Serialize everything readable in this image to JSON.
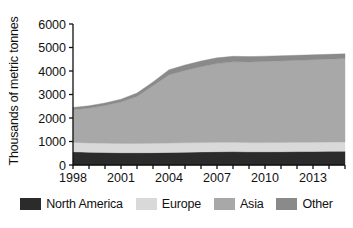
{
  "chart_data": {
    "type": "area",
    "stacked": true,
    "title": "",
    "subtitle": "",
    "xlabel": "",
    "ylabel": "Thousands of metric tonnes",
    "xlim": [
      1998,
      2015
    ],
    "ylim": [
      0,
      6000
    ],
    "grid": false,
    "legend_position": "bottom",
    "x": [
      1998,
      1999,
      2000,
      2001,
      2002,
      2003,
      2004,
      2005,
      2006,
      2007,
      2008,
      2009,
      2010,
      2011,
      2012,
      2013,
      2014,
      2015
    ],
    "xticks": [
      1998,
      2001,
      2004,
      2007,
      2010,
      2013
    ],
    "xtick_labels": [
      "1998",
      "2001",
      "2004",
      "2007",
      "2010",
      "2013"
    ],
    "yticks": [
      0,
      1000,
      2000,
      3000,
      4000,
      5000,
      6000
    ],
    "ytick_labels": [
      "0",
      "1000",
      "2000",
      "3000",
      "4000",
      "5000",
      "6000"
    ],
    "series": [
      {
        "name": "North America",
        "color": "#2b2b2b",
        "values": [
          560,
          540,
          530,
          520,
          520,
          525,
          535,
          545,
          555,
          565,
          570,
          560,
          560,
          565,
          570,
          575,
          580,
          585
        ]
      },
      {
        "name": "Europe",
        "color": "#d9d9d9",
        "values": [
          400,
          400,
          400,
          400,
          400,
          400,
          400,
          400,
          400,
          400,
          400,
          395,
          395,
          395,
          395,
          395,
          395,
          395
        ]
      },
      {
        "name": "Asia",
        "color": "#a8a8a8",
        "values": [
          1400,
          1480,
          1600,
          1760,
          2000,
          2450,
          2900,
          3080,
          3230,
          3350,
          3420,
          3430,
          3450,
          3470,
          3490,
          3510,
          3530,
          3550
        ]
      },
      {
        "name": "Other",
        "color": "#8a8a8a",
        "values": [
          90,
          100,
          110,
          120,
          140,
          160,
          215,
          230,
          240,
          245,
          235,
          230,
          225,
          220,
          215,
          210,
          205,
          200
        ]
      }
    ],
    "totals": [
      2450,
      2520,
      2640,
      2800,
      3060,
      3535,
      4050,
      4255,
      4425,
      4560,
      4625,
      4615,
      4630,
      4650,
      4670,
      4690,
      4710,
      4730
    ]
  },
  "legend": {
    "items": [
      {
        "label": "North America",
        "color": "#2b2b2b"
      },
      {
        "label": "Europe",
        "color": "#d9d9d9"
      },
      {
        "label": "Asia",
        "color": "#a8a8a8"
      },
      {
        "label": "Other",
        "color": "#8a8a8a"
      }
    ]
  }
}
